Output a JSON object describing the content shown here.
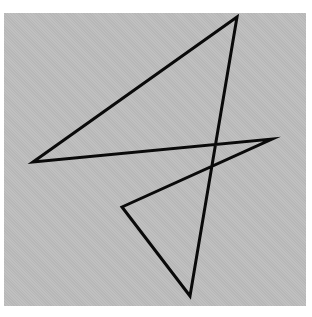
{
  "figure": {
    "background_color": "#ffffff",
    "panel_color": "#bdbdbd",
    "stroke_color": "#0a0a0a",
    "stroke_width": 3,
    "shape": "closed-polyline",
    "vertices": [
      {
        "name": "top",
        "x": 237,
        "y": 17
      },
      {
        "name": "left",
        "x": 33,
        "y": 162
      },
      {
        "name": "right",
        "x": 272,
        "y": 139
      },
      {
        "name": "inner-left",
        "x": 122,
        "y": 207
      },
      {
        "name": "bottom",
        "x": 190,
        "y": 296
      }
    ]
  }
}
